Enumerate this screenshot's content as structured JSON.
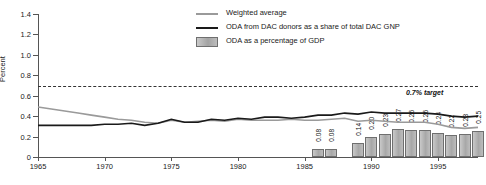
{
  "chart_data": {
    "type": "line",
    "title": "",
    "xlabel": "",
    "ylabel": "Percent",
    "ylim": [
      0,
      1.4
    ],
    "xlim": [
      1965,
      1998
    ],
    "ytick_labels": [
      "0",
      "0.2",
      "0.4",
      "0.6",
      "0.8",
      "1.0",
      "1.2",
      "1.4"
    ],
    "ytick_values": [
      0,
      0.2,
      0.4,
      0.6,
      0.8,
      1.0,
      1.2,
      1.4
    ],
    "xtick_labels": [
      "1965",
      "1970",
      "1975",
      "1980",
      "1985",
      "1990",
      "1995"
    ],
    "xtick_values": [
      1965,
      1970,
      1975,
      1980,
      1985,
      1990,
      1995
    ],
    "grid": false,
    "legend_position": "top-right",
    "annotations": [
      {
        "text": "0.7% target",
        "y": 0.7,
        "style": "dashed-reference-line"
      }
    ],
    "series": [
      {
        "name": "Weighted average",
        "type": "line",
        "color": "#9a9a9a",
        "x": [
          1965,
          1966,
          1967,
          1968,
          1969,
          1970,
          1971,
          1972,
          1973,
          1974,
          1975,
          1976,
          1977,
          1978,
          1979,
          1980,
          1981,
          1982,
          1983,
          1984,
          1985,
          1986,
          1987,
          1988,
          1989,
          1990,
          1991,
          1992,
          1993,
          1994,
          1995,
          1996,
          1997,
          1998
        ],
        "values": [
          0.49,
          0.47,
          0.45,
          0.43,
          0.41,
          0.39,
          0.37,
          0.36,
          0.34,
          0.33,
          0.36,
          0.34,
          0.35,
          0.36,
          0.35,
          0.37,
          0.36,
          0.36,
          0.36,
          0.37,
          0.36,
          0.36,
          0.37,
          0.38,
          0.35,
          0.36,
          0.35,
          0.34,
          0.34,
          0.34,
          0.32,
          0.29,
          0.28,
          0.29
        ]
      },
      {
        "name": "ODA from DAC donors as a share of total DAC GNP",
        "type": "line",
        "color": "#1a1a1a",
        "x": [
          1965,
          1966,
          1967,
          1968,
          1969,
          1970,
          1971,
          1972,
          1973,
          1974,
          1975,
          1976,
          1977,
          1978,
          1979,
          1980,
          1981,
          1982,
          1983,
          1984,
          1985,
          1986,
          1987,
          1988,
          1989,
          1990,
          1991,
          1992,
          1993,
          1994,
          1995,
          1996,
          1997,
          1998
        ],
        "values": [
          0.31,
          0.31,
          0.31,
          0.31,
          0.31,
          0.32,
          0.32,
          0.33,
          0.31,
          0.33,
          0.37,
          0.34,
          0.34,
          0.37,
          0.36,
          0.38,
          0.37,
          0.39,
          0.39,
          0.38,
          0.39,
          0.41,
          0.41,
          0.43,
          0.42,
          0.44,
          0.43,
          0.43,
          0.43,
          0.43,
          0.42,
          0.4,
          0.39,
          0.4
        ]
      },
      {
        "name": "ODA as a percentage of GDP",
        "type": "bar",
        "color": "#b0b0b0",
        "x": [
          1986,
          1987,
          1989,
          1990,
          1991,
          1992,
          1993,
          1994,
          1995,
          1996,
          1997,
          1998
        ],
        "values": [
          0.08,
          0.08,
          0.14,
          0.2,
          0.23,
          0.27,
          0.26,
          0.26,
          0.24,
          0.22,
          0.23,
          0.25
        ],
        "labels": [
          "0.08",
          "0.08",
          "0.14",
          "0.20",
          "0.23",
          "0.27",
          "0.26",
          "0.26",
          "0.24",
          "0.22",
          "0.23",
          "0.25"
        ]
      }
    ]
  },
  "legend": {
    "items": [
      {
        "label": "Weighted average",
        "marker": "line",
        "color": "#9a9a9a"
      },
      {
        "label": "ODA from DAC donors as a share of total DAC GNP",
        "marker": "line",
        "color": "#1a1a1a"
      },
      {
        "label": "ODA as a percentage of GDP",
        "marker": "box",
        "color": "#b0b0b0"
      }
    ]
  }
}
